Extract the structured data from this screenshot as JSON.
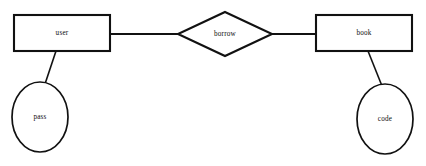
{
  "diagram": {
    "type": "entity-relationship-diagram",
    "background_color": "#ffffff",
    "stroke_color": "#111111",
    "entities": [
      {
        "id": "user",
        "label": "user",
        "shape": "rectangle",
        "x": 14,
        "y": 15,
        "width": 96,
        "height": 36,
        "label_x": 62,
        "label_y": 33
      },
      {
        "id": "book",
        "label": "book",
        "shape": "rectangle",
        "x": 316,
        "y": 15,
        "width": 96,
        "height": 36,
        "label_x": 364,
        "label_y": 33
      }
    ],
    "relationships": [
      {
        "id": "borrow",
        "label": "borrow",
        "shape": "diamond",
        "points": "225,12 272,34 225,56 178,34",
        "label_x": 225,
        "label_y": 34
      }
    ],
    "attributes": [
      {
        "id": "pass",
        "label": "pass",
        "shape": "ellipse",
        "cx": 40,
        "cy": 117,
        "rx": 28,
        "ry": 35,
        "label_x": 40,
        "label_y": 117,
        "belongs_to": "user"
      },
      {
        "id": "code",
        "label": "code",
        "shape": "ellipse",
        "cx": 385,
        "cy": 119,
        "rx": 28,
        "ry": 35,
        "label_x": 385,
        "label_y": 119,
        "belongs_to": "book"
      }
    ],
    "connectors": [
      {
        "id": "user-borrow",
        "from": "user",
        "to": "borrow",
        "x1": 110,
        "y1": 34,
        "x2": 178,
        "y2": 34
      },
      {
        "id": "borrow-book",
        "from": "borrow",
        "to": "book",
        "x1": 272,
        "y1": 34,
        "x2": 316,
        "y2": 34
      },
      {
        "id": "user-pass",
        "from": "user",
        "to": "pass",
        "x1": 56,
        "y1": 51,
        "x2": 45,
        "y2": 84
      },
      {
        "id": "book-code",
        "from": "book",
        "to": "code",
        "x1": 368,
        "y1": 51,
        "x2": 382,
        "y2": 86
      }
    ]
  }
}
